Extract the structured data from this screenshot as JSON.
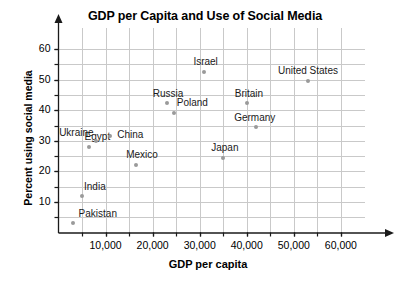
{
  "chart_data": {
    "type": "scatter",
    "title": "GDP per Capita and Use of Social Media",
    "xlabel": "GDP per capita",
    "ylabel": "Percent using social media",
    "xlim": [
      0,
      63000
    ],
    "ylim": [
      0,
      63
    ],
    "grid": true,
    "legend": "none",
    "x_ticks": [
      10000,
      20000,
      30000,
      40000,
      50000,
      60000
    ],
    "x_tick_labels": [
      "10,000",
      "20,000",
      "30,000",
      "40,000",
      "50,000",
      "60,000"
    ],
    "x_minor_step": 5000,
    "y_ticks": [
      10,
      20,
      30,
      40,
      50,
      60
    ],
    "y_tick_labels": [
      "10",
      "20",
      "30",
      "40",
      "50",
      "60"
    ],
    "y_minor_step": 5,
    "point_color": "#9a9a9a",
    "grid_color": "#c9c9c9",
    "axis_color": "#1a1a1a",
    "points": [
      {
        "name": "Pakistan",
        "x": 3000,
        "y": 3,
        "label_dx": 6,
        "label_dy": -15
      },
      {
        "name": "India",
        "x": 5000,
        "y": 12,
        "label_dx": 2,
        "label_dy": -15
      },
      {
        "name": "Egypt",
        "x": 6400,
        "y": 28,
        "label_dx": -4,
        "label_dy": -16
      },
      {
        "name": "Ukraine",
        "x": 8000,
        "y": 30,
        "label_dx": -37,
        "label_dy": -14
      },
      {
        "name": "China",
        "x": 11000,
        "y": 31.5,
        "label_dx": 7,
        "label_dy": -7
      },
      {
        "name": "Mexico",
        "x": 16500,
        "y": 22,
        "label_dx": -10,
        "label_dy": -16
      },
      {
        "name": "Russia",
        "x": 23000,
        "y": 42.5,
        "label_dx": -14,
        "label_dy": -15
      },
      {
        "name": "Poland",
        "x": 24500,
        "y": 39,
        "label_dx": 3,
        "label_dy": -16
      },
      {
        "name": "Japan",
        "x": 35000,
        "y": 24.5,
        "label_dx": -12,
        "label_dy": -16
      },
      {
        "name": "Germany",
        "x": 42000,
        "y": 34.5,
        "label_dx": -22,
        "label_dy": -15
      },
      {
        "name": "Britain",
        "x": 40000,
        "y": 42.5,
        "label_dx": -12,
        "label_dy": -15
      },
      {
        "name": "Israel",
        "x": 31000,
        "y": 52.5,
        "label_dx": -11,
        "label_dy": -16
      },
      {
        "name": "United States",
        "x": 53000,
        "y": 49.5,
        "label_dx": -30,
        "label_dy": -16
      }
    ]
  }
}
